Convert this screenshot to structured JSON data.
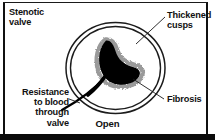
{
  "figure": {
    "caption": "Open",
    "background_color": "#ffffff",
    "ink_color": "#111111"
  },
  "labels": {
    "stenotic_valve": "Stenotic\nvalve",
    "thickened_cusps": "Thickened\ncusps",
    "fibrosis": "Fibrosis",
    "resistance": "Resistance\nto blood\nthrough\nvalve"
  },
  "diagram": {
    "outer_ring_label": "valve-annulus-outer-ring",
    "inner_ring_label": "valve-annulus-inner-ring",
    "orifice_label": "narrowed-valve-orifice",
    "fibrosis_halo_label": "fibrosis-stipple-halo",
    "flow_arrow_label": "blood-flow-resistance-line",
    "ring_color": "#1c1c1c",
    "orifice_color": "#000000",
    "halo_color": "#9a9a9a"
  },
  "leaders": {
    "thickened_cusps_leader": "leader-line-thickened-cusps",
    "fibrosis_leader": "leader-line-fibrosis",
    "resistance_leader": "leader-line-resistance"
  }
}
